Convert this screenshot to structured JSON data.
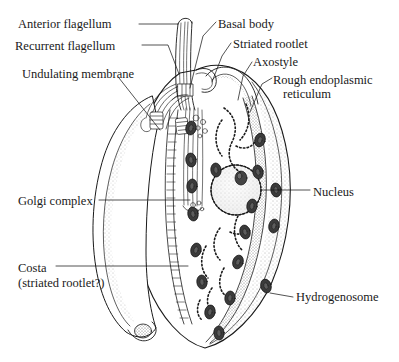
{
  "figure": {
    "background_color": "#ffffff",
    "ink_color": "#1a1a1a",
    "style": "black-and-white line drawing with stipple shading"
  },
  "labels": {
    "left": [
      {
        "id": "anterior-flagellum",
        "text": "Anterior flagellum",
        "x": 18,
        "y": 17
      },
      {
        "id": "recurrent-flagellum",
        "text": "Recurrent flagellum",
        "x": 15,
        "y": 39
      },
      {
        "id": "undulating-membrane",
        "text": "Undulating membrane",
        "x": 22,
        "y": 67
      },
      {
        "id": "golgi-complex",
        "text": "Golgi complex",
        "x": 18,
        "y": 194
      },
      {
        "id": "costa",
        "text": "Costa",
        "x": 18,
        "y": 261
      },
      {
        "id": "costa-sub",
        "text": "(striated rootlet?)",
        "x": 18,
        "y": 276
      }
    ],
    "right": [
      {
        "id": "basal-body",
        "text": "Basal body",
        "x": 218,
        "y": 17
      },
      {
        "id": "striated-rootlet",
        "text": "Striated rootlet",
        "x": 233,
        "y": 37
      },
      {
        "id": "axostyle",
        "text": "Axostyle",
        "x": 253,
        "y": 55
      },
      {
        "id": "rough-er",
        "text": "Rough endoplasmic",
        "x": 273,
        "y": 73
      },
      {
        "id": "rough-er-2",
        "text": "reticulum",
        "x": 283,
        "y": 87
      },
      {
        "id": "nucleus",
        "text": "Nucleus",
        "x": 313,
        "y": 185
      },
      {
        "id": "hydrogenosome",
        "text": "Hydrogenosome",
        "x": 296,
        "y": 290
      }
    ]
  },
  "structures": [
    {
      "id": "cell-body",
      "name": "cell body outline"
    },
    {
      "id": "anterior-flagella-bundle",
      "name": "anterior flagella bundle"
    },
    {
      "id": "recurrent-flagellum-strand",
      "name": "recurrent flagellum"
    },
    {
      "id": "undulating-membrane-lobe",
      "name": "undulating membrane"
    },
    {
      "id": "costa-ladder",
      "name": "striated costa"
    },
    {
      "id": "axostyle-band",
      "name": "axostyle"
    },
    {
      "id": "nucleus-body",
      "name": "nucleus with nucleolus"
    },
    {
      "id": "rough-er-network",
      "name": "rough endoplasmic reticulum"
    },
    {
      "id": "golgi-stack",
      "name": "Golgi complex"
    },
    {
      "id": "hydrogenosome-group",
      "name": "hydrogenosomes"
    }
  ]
}
